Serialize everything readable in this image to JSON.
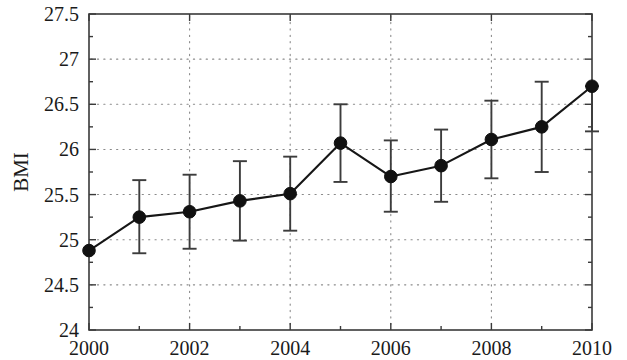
{
  "chart_data": {
    "type": "line",
    "title": "",
    "subtitle": "",
    "xlabel": "",
    "ylabel": "BMI",
    "x": [
      2000,
      2001,
      2002,
      2003,
      2004,
      2005,
      2006,
      2007,
      2008,
      2009,
      2010
    ],
    "values": [
      24.88,
      25.25,
      25.31,
      25.43,
      25.51,
      26.07,
      25.7,
      25.82,
      26.11,
      26.25,
      26.7
    ],
    "error_low": [
      24.88,
      24.85,
      24.9,
      24.99,
      25.1,
      25.64,
      25.31,
      25.42,
      25.68,
      25.75,
      26.2
    ],
    "error_high": [
      24.88,
      25.66,
      25.72,
      25.87,
      25.92,
      26.5,
      26.1,
      26.22,
      26.54,
      26.75,
      26.7
    ],
    "series": [
      {
        "name": "BMI",
        "values": [
          24.88,
          25.25,
          25.31,
          25.43,
          25.51,
          26.07,
          25.7,
          25.82,
          26.11,
          26.25,
          26.7
        ]
      }
    ],
    "xlim": [
      2000,
      2010
    ],
    "ylim": [
      24,
      27.5
    ],
    "ytick_values": [
      24,
      24.5,
      25,
      25.5,
      26,
      26.5,
      27,
      27.5
    ],
    "ytick_labels": [
      "24",
      "24.5",
      "25",
      "25.5",
      "26",
      "26.5",
      "27",
      "27.5"
    ],
    "yminor_tick_values": [
      24.25,
      24.75,
      25.25,
      25.75,
      26.25,
      26.75,
      27.25
    ],
    "xtick_values": [
      2000,
      2002,
      2004,
      2006,
      2008,
      2010
    ],
    "xtick_labels": [
      "2000",
      "2002",
      "2004",
      "2006",
      "2008",
      "2010"
    ],
    "xminor_tick_values": [
      2001,
      2003,
      2005,
      2007,
      2009
    ],
    "grid": true,
    "grid_style": "dotted",
    "legend": null,
    "legend_position": "none",
    "marker": "filled-circle",
    "errorbars": true,
    "colors": {
      "line": "#161616",
      "marker": "#111111",
      "errorbar": "#3c3c3c",
      "grid": "#8a8a8a",
      "frame": "#3a3a3a",
      "background": "#ffffff",
      "text": "#1a1a1a"
    }
  },
  "axes": {
    "y_axis_title": "BMI"
  }
}
